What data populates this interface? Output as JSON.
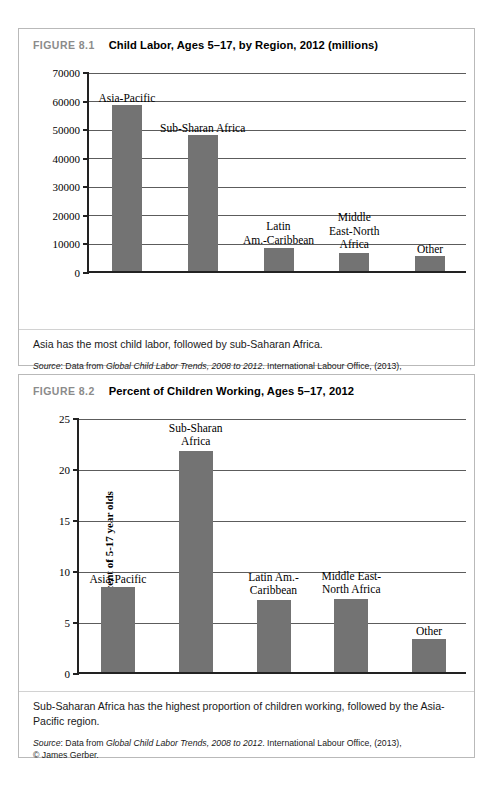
{
  "figure1": {
    "number": "FIGURE 8.1",
    "title": "Child Labor, Ages 5–17, by Region, 2012 (millions)",
    "caption": "Asia has the most child labor, followed by sub-Saharan Africa.",
    "source_prefix": "Source",
    "source_lead": ": Data from ",
    "source_italic": "Global Child Labor Trends, 2008 to 2012",
    "source_tail": ". International Labour Office, (2013),",
    "source_line2": "© James Gerber."
  },
  "figure2": {
    "number": "FIGURE 8.2",
    "title": "Percent of Children Working, Ages 5–17, 2012",
    "caption": "Sub-Saharan Africa has the highest proportion of children working, followed by the Asia-Pacific region.",
    "source_prefix": "Source",
    "source_lead": ": Data from ",
    "source_italic": "Global Child Labor Trends, 2008 to 2012",
    "source_tail": ". International Labour Office, (2013),",
    "source_line2": "© James Gerber."
  },
  "chart_data": [
    {
      "type": "bar",
      "title": "Child Labor, Ages 5–17, by Region, 2012 (millions)",
      "xlabel": "",
      "ylabel": "Millions",
      "ylim": [
        0,
        70000
      ],
      "yticks": [
        0,
        10000,
        20000,
        30000,
        40000,
        50000,
        60000,
        70000
      ],
      "ytick_labels": [
        "0",
        "10000",
        "20000",
        "30000",
        "40000",
        "50000",
        "60000",
        "70000"
      ],
      "grid": true,
      "legend": "none",
      "bar_color": "#737373",
      "categories": [
        "Asia-Pacific",
        "Sub-Sharan Africa",
        "Latin\nAm.-Caribbean",
        "Middle\nEast-North\nAfrica",
        "Other"
      ],
      "values": [
        58000,
        47500,
        8000,
        6200,
        5200
      ]
    },
    {
      "type": "bar",
      "title": "Percent of Children Working, Ages 5–17, 2012",
      "xlabel": "",
      "ylabel": "Percent of 5-17 year olds",
      "ylim": [
        0,
        25
      ],
      "yticks": [
        0,
        5,
        10,
        15,
        20,
        25
      ],
      "ytick_labels": [
        "0",
        "5",
        "10",
        "15",
        "20",
        "25"
      ],
      "grid": true,
      "legend": "none",
      "bar_color": "#737373",
      "categories": [
        "Asia-Pacific",
        "Sub-Sharan\nAfrica",
        "Latin Am.-\nCaribbean",
        "Middle East-\nNorth Africa",
        "Other"
      ],
      "values": [
        8.3,
        21.7,
        7.1,
        7.2,
        3.2
      ]
    }
  ]
}
